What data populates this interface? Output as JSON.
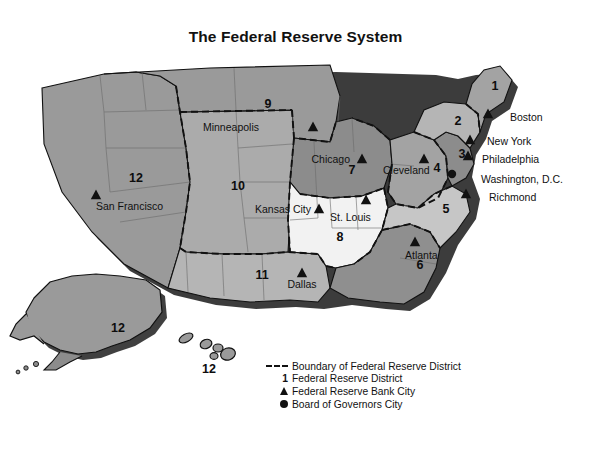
{
  "title": "The Federal Reserve System",
  "colors": {
    "background": "#ffffff",
    "ink": "#111111",
    "shadow": "#2b2b2b",
    "fill_dark": "#8c8c8c",
    "fill_medium": "#a3a3a3",
    "fill_light_medium": "#b5b5b5",
    "fill_light": "#c6c6c6",
    "fill_pale": "#e8e8e8",
    "fill_white": "#f2f2f2",
    "state_line": "#6b6b6b",
    "boundary": "#111111"
  },
  "districts": [
    {
      "number": "1",
      "city": "Boston",
      "fill": "#a3a3a3"
    },
    {
      "number": "2",
      "city": "New York",
      "fill": "#b5b5b5"
    },
    {
      "number": "3",
      "city": "Philadelphia",
      "fill": "#8c8c8c"
    },
    {
      "number": "4",
      "city": "Cleveland",
      "fill": "#a3a3a3"
    },
    {
      "number": "5",
      "city": "Richmond",
      "fill": "#c6c6c6"
    },
    {
      "number": "6",
      "city": "Atlanta",
      "fill": "#8f8f8f"
    },
    {
      "number": "7",
      "city": "Chicago",
      "fill": "#8c8c8c"
    },
    {
      "number": "8",
      "city": "St. Louis",
      "fill": "#f2f2f2"
    },
    {
      "number": "9",
      "city": "Minneapolis",
      "fill": "#9a9a9a"
    },
    {
      "number": "10",
      "city": "Kansas City",
      "fill": "#ababab"
    },
    {
      "number": "11",
      "city": "Dallas",
      "fill": "#b5b5b5"
    },
    {
      "number": "12",
      "city": "San Francisco",
      "fill": "#9a9a9a"
    }
  ],
  "district_number_labels": [
    {
      "id": "num-1",
      "text": "1",
      "x": 495,
      "y": 38
    },
    {
      "id": "num-2",
      "text": "2",
      "x": 458,
      "y": 73
    },
    {
      "id": "num-3",
      "text": "3",
      "x": 462,
      "y": 106
    },
    {
      "id": "num-4",
      "text": "4",
      "x": 437,
      "y": 120
    },
    {
      "id": "num-5",
      "text": "5",
      "x": 446,
      "y": 161
    },
    {
      "id": "num-6",
      "text": "6",
      "x": 420,
      "y": 217
    },
    {
      "id": "num-7",
      "text": "7",
      "x": 352,
      "y": 122
    },
    {
      "id": "num-8",
      "text": "8",
      "x": 340,
      "y": 189
    },
    {
      "id": "num-9",
      "text": "9",
      "x": 268,
      "y": 56
    },
    {
      "id": "num-10",
      "text": "10",
      "x": 238,
      "y": 138
    },
    {
      "id": "num-11",
      "text": "11",
      "x": 262,
      "y": 227
    },
    {
      "id": "num-12",
      "text": "12",
      "x": 136,
      "y": 130
    },
    {
      "id": "num-12-alaska",
      "text": "12",
      "x": 118,
      "y": 280
    },
    {
      "id": "num-12-hawaii",
      "text": "12",
      "x": 209,
      "y": 321
    }
  ],
  "bank_city_labels": [
    {
      "id": "city-minneapolis",
      "text": "Minneapolis",
      "x": 259,
      "y": 79,
      "anchor": "end",
      "marker_x": 313,
      "marker_y": 75
    },
    {
      "id": "city-chicago",
      "text": "Chicago",
      "x": 350,
      "y": 111,
      "anchor": "end",
      "marker_x": 362,
      "marker_y": 107
    },
    {
      "id": "city-cleveland",
      "text": "Cleveland",
      "x": 383,
      "y": 122,
      "anchor": "start",
      "marker_x": 424,
      "marker_y": 107
    },
    {
      "id": "city-kansas-city",
      "text": "Kansas City",
      "x": 311,
      "y": 161,
      "anchor": "end",
      "marker_x": 319,
      "marker_y": 157
    },
    {
      "id": "city-st-louis",
      "text": "St. Louis",
      "x": 330,
      "y": 169,
      "anchor": "start",
      "marker_x": 366,
      "marker_y": 148
    },
    {
      "id": "city-atlanta",
      "text": "Atlanta",
      "x": 405,
      "y": 207,
      "anchor": "start",
      "marker_x": 415,
      "marker_y": 190
    },
    {
      "id": "city-dallas",
      "text": "Dallas",
      "x": 302,
      "y": 236,
      "anchor": "middle",
      "marker_x": 302,
      "marker_y": 221
    },
    {
      "id": "city-san-francisco",
      "text": "San Francisco",
      "x": 96,
      "y": 158,
      "anchor": "start",
      "marker_x": 96,
      "marker_y": 143
    }
  ],
  "coast_city_labels": [
    {
      "id": "coast-boston",
      "text": "Boston",
      "x": 510,
      "y": 69,
      "marker_x": 488,
      "marker_y": 62,
      "marker": "triangle"
    },
    {
      "id": "coast-new-york",
      "text": "New York",
      "x": 487,
      "y": 93,
      "marker_x": 470,
      "marker_y": 88,
      "marker": "triangle"
    },
    {
      "id": "coast-philadelphia",
      "text": "Philadelphia",
      "x": 482,
      "y": 111,
      "marker_x": 468,
      "marker_y": 104,
      "marker": "triangle"
    },
    {
      "id": "coast-washington",
      "text": "Washington, D.C.",
      "x": 481,
      "y": 131,
      "marker_x": 452,
      "marker_y": 124,
      "marker": "dot"
    },
    {
      "id": "coast-richmond",
      "text": "Richmond",
      "x": 489,
      "y": 149,
      "marker_x": 466,
      "marker_y": 142,
      "marker": "triangle"
    }
  ],
  "legend": {
    "items": [
      {
        "symbol": "dashed-line",
        "text": "Boundary of Federal Reserve District"
      },
      {
        "symbol": "number-1",
        "text": "Federal Reserve District"
      },
      {
        "symbol": "triangle",
        "text": "Federal Reserve Bank City"
      },
      {
        "symbol": "dot",
        "text": "Board of Governors City"
      }
    ],
    "number_symbol": "1"
  }
}
